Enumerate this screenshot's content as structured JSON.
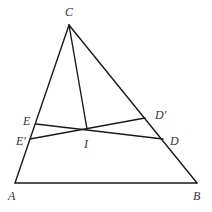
{
  "diagram": {
    "type": "geometry-triangle",
    "points": {
      "A": {
        "x": 15,
        "y": 183
      },
      "B": {
        "x": 197,
        "y": 183
      },
      "C": {
        "x": 69,
        "y": 25
      },
      "E": {
        "x": 36,
        "y": 124
      },
      "E_prime": {
        "x": 30,
        "y": 139
      },
      "I": {
        "x": 87,
        "y": 129
      },
      "D": {
        "x": 163,
        "y": 139
      },
      "D_prime": {
        "x": 145,
        "y": 118
      }
    },
    "labels": {
      "A": "A",
      "B": "B",
      "C": "C",
      "E": "E",
      "E_prime": "E′",
      "I": "I",
      "D": "D",
      "D_prime": "D′"
    },
    "segments": [
      [
        "A",
        "B"
      ],
      [
        "B",
        "C"
      ],
      [
        "C",
        "A"
      ],
      [
        "C",
        "I"
      ],
      [
        "E",
        "D"
      ],
      [
        "E_prime",
        "D_prime"
      ]
    ],
    "colors": {
      "stroke": "#1a1a1a",
      "label": "#333333",
      "background": "#ffffff"
    }
  }
}
